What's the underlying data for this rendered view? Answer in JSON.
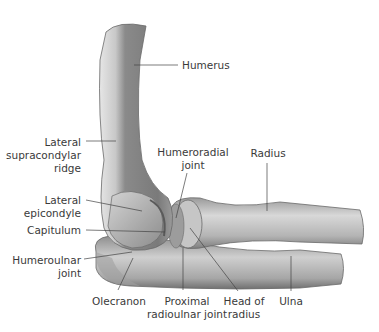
{
  "figure": {
    "colors": {
      "background": "#ffffff",
      "bone_dark": "#7d7d7d",
      "bone_mid": "#a9a9a9",
      "bone_light": "#d9d9d9",
      "leader_line": "#444444",
      "label_text": "#3a3a3a"
    }
  },
  "labels": {
    "humerus": "Humerus",
    "lateral_supracondylar_ridge": [
      "Lateral",
      "supracondylar",
      "ridge"
    ],
    "humeroradial_joint": [
      "Humeroradial",
      "joint"
    ],
    "radius": "Radius",
    "lateral_epicondyle": [
      "Lateral",
      "epicondyle"
    ],
    "capitulum": "Capitulum",
    "humeroulnar_joint": [
      "Humeroulnar",
      "joint"
    ],
    "olecranon": "Olecranon",
    "proximal_radioulnar_joint": [
      "Proximal",
      "radioulnar joint"
    ],
    "head_of_radius": [
      "Head of",
      "radius"
    ],
    "ulna": "Ulna"
  }
}
